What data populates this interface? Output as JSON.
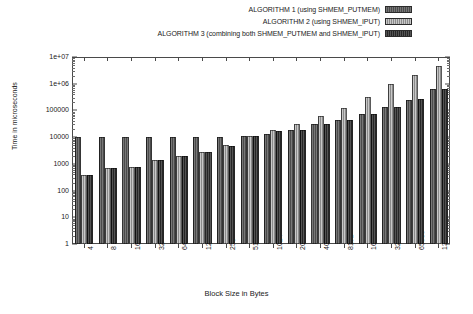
{
  "chart_data": {
    "type": "bar",
    "title": "",
    "subtitle": "",
    "xlabel": "Block Size in Bytes",
    "ylabel": "Time in microseconds",
    "yscale": "log",
    "ylim": [
      1,
      10000000
    ],
    "ytick_labels": [
      "1",
      "10",
      "100",
      "1000",
      "10000",
      "100000",
      "1e+06",
      "1e+07"
    ],
    "ytick_values": [
      1,
      10,
      100,
      1000,
      10000,
      100000,
      1000000,
      10000000
    ],
    "grid": false,
    "legend_position": "top-right",
    "categories": [
      "4",
      "8",
      "16",
      "32",
      "64",
      "128",
      "256",
      "512",
      "1024",
      "2048",
      "4096",
      "8192",
      "16384",
      "32768",
      "65536",
      "131072"
    ],
    "series": [
      {
        "name": "ALGORITHM 1 (using SHMEM_PUTMEM)",
        "style": "dark-gray-hatch",
        "color": "#555555",
        "values": [
          10000,
          10000,
          10000,
          10000,
          10000,
          10000,
          10000,
          11000,
          13000,
          19000,
          30000,
          44000,
          75000,
          130000,
          250000,
          620000
        ]
      },
      {
        "name": "ALGORITHM 2 (using SHMEM_IPUT)",
        "style": "light-gray-hatch",
        "color": "#9b9b9b",
        "values": [
          370,
          700,
          760,
          1350,
          1900,
          2800,
          5200,
          11500,
          19000,
          31000,
          62000,
          125000,
          330000,
          1000000,
          2200000,
          4700000
        ]
      },
      {
        "name": "ALGORITHM 3 (combining both SHMEM_PUTMEM and SHMEM_IPUT)",
        "style": "black-hatch",
        "color": "#333333",
        "values": [
          370,
          700,
          760,
          1350,
          1900,
          2800,
          4600,
          11000,
          17500,
          19000,
          30000,
          44000,
          75000,
          135000,
          260000,
          650000
        ]
      }
    ]
  },
  "legend": {
    "items": [
      {
        "label": "ALGORITHM 1 (using SHMEM_PUTMEM)"
      },
      {
        "label": "ALGORITHM 2 (using SHMEM_IPUT)"
      },
      {
        "label": "ALGORITHM 3 (combining both SHMEM_PUTMEM and SHMEM_IPUT)"
      }
    ]
  }
}
